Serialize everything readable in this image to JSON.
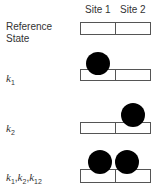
{
  "header": {
    "site1_label": "Site 1",
    "site2_label": "Site 2"
  },
  "rows": [
    {
      "id": "reference",
      "label_line1": "Reference",
      "label_line2": "State",
      "occupied_sites": []
    },
    {
      "id": "k1",
      "label_var": "k",
      "label_sub": "1",
      "occupied_sites": [
        1
      ]
    },
    {
      "id": "k2",
      "label_var": "k",
      "label_sub": "2",
      "occupied_sites": [
        2
      ]
    },
    {
      "id": "k1k2k12",
      "label_parts": [
        {
          "var": "k",
          "sub": "1"
        },
        {
          "var": "k",
          "sub": "2"
        },
        {
          "var": "k",
          "sub": "12"
        }
      ],
      "separator": ",",
      "occupied_sites": [
        1,
        2
      ]
    }
  ],
  "colors": {
    "ligand": "#000000",
    "box_border": "#555555",
    "text": "#333333"
  }
}
